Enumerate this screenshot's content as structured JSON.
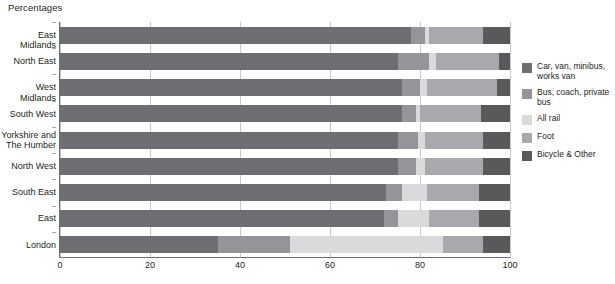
{
  "chart": {
    "title": "Percentages",
    "axis_label_x": "",
    "axis_label_y": ""
  },
  "xaxis": {
    "ticks": [
      "0",
      "20",
      "40",
      "60",
      "80",
      "100"
    ]
  },
  "legend": {
    "items": [
      {
        "label": "Car, van, minibus,\nworks van",
        "color": "#6d6e71"
      },
      {
        "label": "Bus, coach, private\nbus",
        "color": "#939598"
      },
      {
        "label": "All rail",
        "color": "#d9dadb"
      },
      {
        "label": "Foot",
        "color": "#a7a9ac"
      },
      {
        "label": "Bicycle & Other",
        "color": "#58595b"
      }
    ]
  },
  "chart_data": {
    "type": "bar",
    "orientation": "horizontal",
    "stacked": true,
    "title": "Percentages",
    "xlabel": "",
    "ylabel": "",
    "xlim": [
      0,
      100
    ],
    "grid": true,
    "legend_position": "right",
    "categories": [
      "East Midlands",
      "North East",
      "West Midlands",
      "South West",
      "Yorkshire and\nThe Humber",
      "North West",
      "South East",
      "East",
      "London"
    ],
    "series": [
      {
        "name": "Car, van, minibus, works van",
        "color": "#6d6e71",
        "values": [
          78,
          75,
          76,
          76,
          75,
          75,
          72.5,
          72,
          35
        ]
      },
      {
        "name": "Bus, coach, private bus",
        "color": "#939598",
        "values": [
          3,
          7,
          4,
          3,
          4.5,
          4,
          3.5,
          3,
          16
        ]
      },
      {
        "name": "All rail",
        "color": "#d9dadb",
        "values": [
          1,
          1.5,
          1.5,
          1,
          1.5,
          2,
          5.5,
          7,
          34
        ]
      },
      {
        "name": "Foot",
        "color": "#a7a9ac",
        "values": [
          12,
          14,
          15.5,
          13.5,
          13,
          13,
          11.5,
          11,
          9
        ]
      },
      {
        "name": "Bicycle & Other",
        "color": "#58595b",
        "values": [
          6,
          2.5,
          3,
          6.5,
          6,
          6,
          7,
          7,
          6
        ]
      }
    ]
  }
}
